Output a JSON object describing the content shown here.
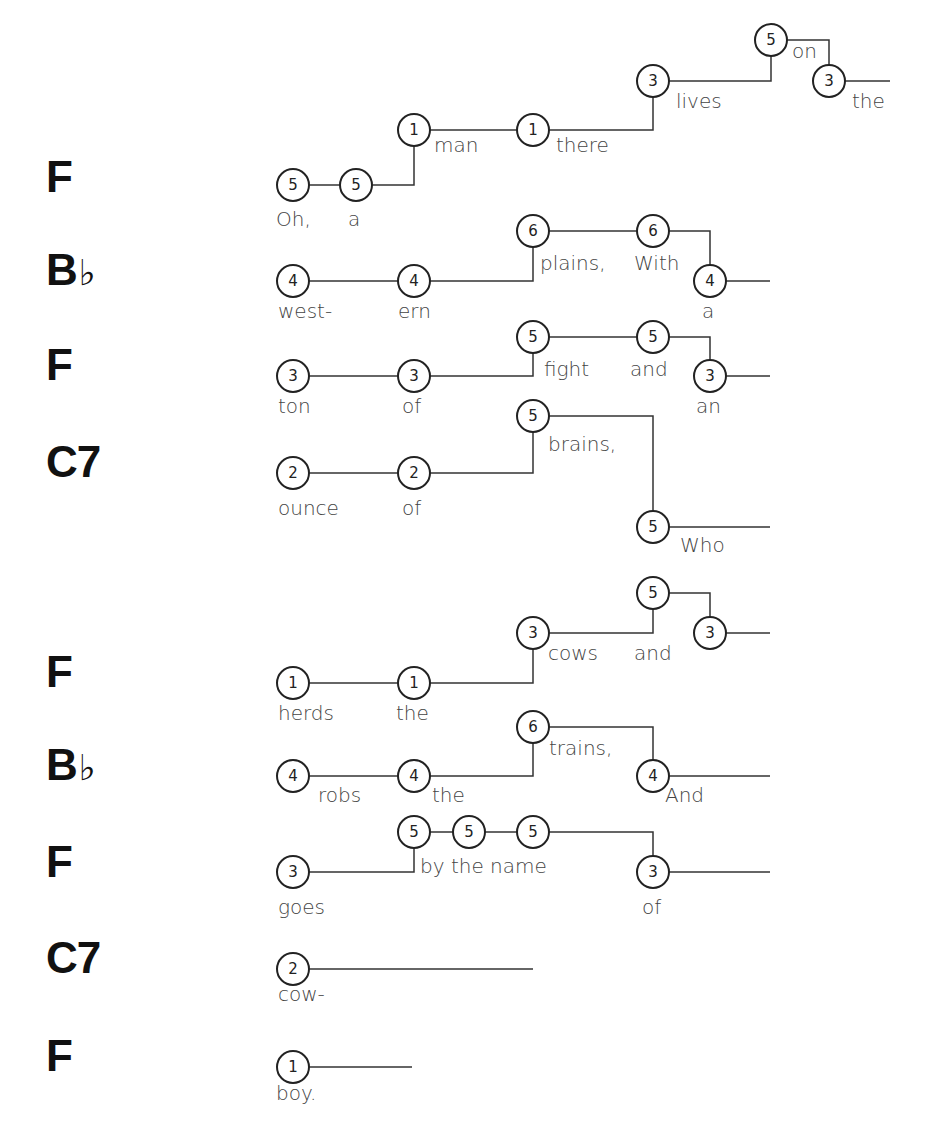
{
  "diagram": {
    "style": {
      "line_color": "#333333",
      "circle_stroke": "#222222",
      "chord_color": "#111111",
      "lyric_color": "#444444"
    },
    "rows": [
      {
        "chord": "F",
        "chord_y": 177,
        "notes": [
          {
            "n": "5",
            "x": 293,
            "y": 185,
            "lyric": "Oh,",
            "lx": 276,
            "ly": 226
          },
          {
            "n": "5",
            "x": 356,
            "y": 185,
            "lyric": "a",
            "lx": 348,
            "ly": 226
          },
          {
            "n": "1",
            "x": 414,
            "y": 130,
            "lyric": "man",
            "lx": 434,
            "ly": 152
          },
          {
            "n": "1",
            "x": 533,
            "y": 130,
            "lyric": "there",
            "lx": 556,
            "ly": 152
          },
          {
            "n": "3",
            "x": 653,
            "y": 81,
            "lyric": "lives",
            "lx": 676,
            "ly": 108
          },
          {
            "n": "5",
            "x": 771,
            "y": 40,
            "lyric": "on",
            "lx": 792,
            "ly": 58
          },
          {
            "n": "3",
            "x": 829,
            "y": 81,
            "lyric": "the",
            "lx": 852,
            "ly": 108
          }
        ],
        "end_x": 890
      },
      {
        "chord": "B♭",
        "chord_y": 270,
        "notes": [
          {
            "n": "4",
            "x": 293,
            "y": 281,
            "lyric": "west-",
            "lx": 278,
            "ly": 318
          },
          {
            "n": "4",
            "x": 414,
            "y": 281,
            "lyric": "ern",
            "lx": 398,
            "ly": 318
          },
          {
            "n": "6",
            "x": 533,
            "y": 231,
            "lyric": "plains,",
            "lx": 540,
            "ly": 270
          },
          {
            "n": "6",
            "x": 653,
            "y": 231,
            "lyric": "With",
            "lx": 634,
            "ly": 270
          },
          {
            "n": "4",
            "x": 710,
            "y": 281,
            "lyric": "a",
            "lx": 702,
            "ly": 318
          }
        ],
        "end_x": 770
      },
      {
        "chord": "F",
        "chord_y": 365,
        "notes": [
          {
            "n": "3",
            "x": 293,
            "y": 376,
            "lyric": "ton",
            "lx": 278,
            "ly": 413
          },
          {
            "n": "3",
            "x": 414,
            "y": 376,
            "lyric": "of",
            "lx": 402,
            "ly": 413
          },
          {
            "n": "5",
            "x": 533,
            "y": 337,
            "lyric": "fight",
            "lx": 544,
            "ly": 376
          },
          {
            "n": "5",
            "x": 653,
            "y": 337,
            "lyric": "and",
            "lx": 630,
            "ly": 376
          },
          {
            "n": "3",
            "x": 710,
            "y": 376,
            "lyric": "an",
            "lx": 696,
            "ly": 413
          }
        ],
        "end_x": 770
      },
      {
        "chord": "C7",
        "chord_y": 462,
        "notes": [
          {
            "n": "2",
            "x": 293,
            "y": 473,
            "lyric": "ounce",
            "lx": 278,
            "ly": 515
          },
          {
            "n": "2",
            "x": 414,
            "y": 473,
            "lyric": "of",
            "lx": 402,
            "ly": 515
          },
          {
            "n": "5",
            "x": 533,
            "y": 416,
            "lyric": "brains,",
            "lx": 548,
            "ly": 451
          },
          {
            "n": "5",
            "x": 653,
            "y": 527,
            "lyric": "Who",
            "lx": 680,
            "ly": 552
          }
        ],
        "end_x": 770
      },
      {
        "chord": "F",
        "chord_y": 672,
        "notes": [
          {
            "n": "1",
            "x": 293,
            "y": 683,
            "lyric": "herds",
            "lx": 278,
            "ly": 720
          },
          {
            "n": "1",
            "x": 414,
            "y": 683,
            "lyric": "the",
            "lx": 396,
            "ly": 720
          },
          {
            "n": "3",
            "x": 533,
            "y": 633,
            "lyric": "cows",
            "lx": 548,
            "ly": 660
          },
          {
            "n": "5",
            "x": 653,
            "y": 593,
            "lyric": "and",
            "lx": 634,
            "ly": 660
          },
          {
            "n": "3",
            "x": 710,
            "y": 633,
            "lyric": "",
            "lx": 0,
            "ly": 0
          }
        ],
        "end_x": 770
      },
      {
        "chord": "B♭",
        "chord_y": 765,
        "notes": [
          {
            "n": "4",
            "x": 293,
            "y": 776,
            "lyric": "robs",
            "lx": 318,
            "ly": 802
          },
          {
            "n": "4",
            "x": 414,
            "y": 776,
            "lyric": "the",
            "lx": 432,
            "ly": 802
          },
          {
            "n": "6",
            "x": 533,
            "y": 727,
            "lyric": "trains,",
            "lx": 549,
            "ly": 755
          },
          {
            "n": "4",
            "x": 653,
            "y": 776,
            "lyric": "And",
            "lx": 665,
            "ly": 802
          }
        ],
        "end_x": 770
      },
      {
        "chord": "F",
        "chord_y": 862,
        "notes": [
          {
            "n": "3",
            "x": 293,
            "y": 872,
            "lyric": "goes",
            "lx": 278,
            "ly": 914
          },
          {
            "n": "5",
            "x": 414,
            "y": 832,
            "lyric": "by the name",
            "lx": 420,
            "ly": 873
          },
          {
            "n": "5",
            "x": 469,
            "y": 832,
            "lyric": "",
            "lx": 0,
            "ly": 0
          },
          {
            "n": "5",
            "x": 533,
            "y": 832,
            "lyric": "",
            "lx": 0,
            "ly": 0
          },
          {
            "n": "3",
            "x": 653,
            "y": 872,
            "lyric": "of",
            "lx": 642,
            "ly": 914
          }
        ],
        "end_x": 770
      },
      {
        "chord": "C7",
        "chord_y": 958,
        "notes": [
          {
            "n": "2",
            "x": 293,
            "y": 969,
            "lyric": "cow-",
            "lx": 278,
            "ly": 1001
          }
        ],
        "end_x": 533
      },
      {
        "chord": "F",
        "chord_y": 1056,
        "notes": [
          {
            "n": "1",
            "x": 293,
            "y": 1067,
            "lyric": "boy.",
            "lx": 276,
            "ly": 1100
          }
        ],
        "end_x": 412
      }
    ]
  }
}
